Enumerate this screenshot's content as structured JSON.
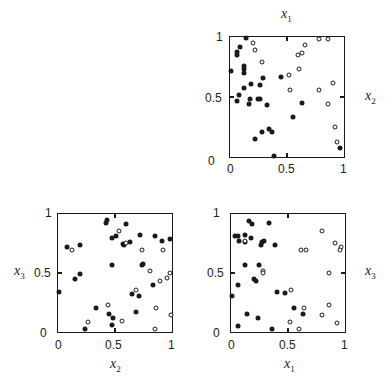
{
  "chart_data": [
    {
      "type": "scatter",
      "id": "x1_vs_x2",
      "title": "",
      "xlabel": "x1",
      "ylabel": "x2",
      "xlabel_position": "top",
      "ylabel_position": "right",
      "xlim": [
        0,
        1
      ],
      "ylim": [
        0,
        1
      ],
      "xticks": [
        "0",
        "0.5",
        "1"
      ],
      "yticks": [
        "0",
        "0.5",
        "1"
      ],
      "grid": false,
      "series": [
        {
          "name": "filled",
          "marker": "filled-circle",
          "points": [
            [
              0.13,
              1.0
            ],
            [
              0.08,
              0.92
            ],
            [
              0.05,
              0.88
            ],
            [
              0.05,
              0.86
            ],
            [
              0.0,
              0.72
            ],
            [
              0.12,
              0.76
            ],
            [
              0.12,
              0.74
            ],
            [
              0.12,
              0.7
            ],
            [
              0.12,
              0.58
            ],
            [
              0.18,
              0.61
            ],
            [
              0.29,
              0.66
            ],
            [
              0.26,
              0.6
            ],
            [
              0.07,
              0.52
            ],
            [
              0.05,
              0.47
            ],
            [
              0.17,
              0.48
            ],
            [
              0.16,
              0.44
            ],
            [
              0.24,
              0.48
            ],
            [
              0.26,
              0.48
            ],
            [
              0.32,
              0.43
            ],
            [
              0.45,
              0.67
            ],
            [
              0.63,
              0.45
            ],
            [
              0.55,
              0.33
            ],
            [
              0.34,
              0.23
            ],
            [
              0.37,
              0.2
            ],
            [
              0.28,
              0.2
            ],
            [
              0.21,
              0.14
            ],
            [
              0.38,
              0.0
            ],
            [
              0.97,
              0.07
            ]
          ]
        },
        {
          "name": "open",
          "marker": "open-circle",
          "points": [
            [
              0.2,
              0.96
            ],
            [
              0.21,
              0.9
            ],
            [
              0.28,
              0.8
            ],
            [
              0.52,
              0.69
            ],
            [
              0.53,
              0.56
            ],
            [
              0.6,
              0.86
            ],
            [
              0.63,
              0.87
            ],
            [
              0.66,
              0.94
            ],
            [
              0.61,
              0.74
            ],
            [
              0.79,
              0.99
            ],
            [
              0.87,
              0.99
            ],
            [
              0.79,
              0.56
            ],
            [
              0.91,
              0.62
            ],
            [
              0.87,
              0.44
            ],
            [
              0.93,
              0.25
            ],
            [
              0.95,
              0.12
            ]
          ]
        }
      ]
    },
    {
      "type": "scatter",
      "id": "x2_vs_x3",
      "title": "",
      "xlabel": "x2",
      "ylabel": "x3",
      "xlabel_position": "bottom",
      "ylabel_position": "left",
      "xlim": [
        0,
        1
      ],
      "ylim": [
        0,
        1
      ],
      "xticks": [
        "0",
        "0.5",
        "1"
      ],
      "yticks": [
        "0",
        "0.5",
        "1"
      ],
      "grid": false,
      "series": [
        {
          "name": "filled",
          "marker": "filled-circle",
          "points": [
            [
              0.43,
              0.96
            ],
            [
              0.42,
              0.93
            ],
            [
              0.6,
              0.92
            ],
            [
              0.47,
              0.8
            ],
            [
              0.51,
              0.82
            ],
            [
              0.57,
              0.75
            ],
            [
              0.58,
              0.74
            ],
            [
              0.63,
              0.77
            ],
            [
              0.72,
              0.83
            ],
            [
              0.86,
              0.82
            ],
            [
              0.92,
              0.78
            ],
            [
              0.99,
              0.79
            ],
            [
              0.07,
              0.72
            ],
            [
              0.19,
              0.74
            ],
            [
              0.47,
              0.57
            ],
            [
              0.74,
              0.57
            ],
            [
              0.75,
              0.58
            ],
            [
              0.19,
              0.49
            ],
            [
              0.14,
              0.45
            ],
            [
              0.84,
              0.4
            ],
            [
              0.0,
              0.34
            ],
            [
              0.65,
              0.32
            ],
            [
              0.71,
              0.3
            ],
            [
              0.33,
              0.2
            ],
            [
              0.45,
              0.15
            ],
            [
              0.48,
              0.11
            ],
            [
              0.69,
              0.16
            ],
            [
              0.47,
              0.05
            ],
            [
              0.23,
              0.02
            ]
          ]
        },
        {
          "name": "open",
          "marker": "open-circle",
          "points": [
            [
              0.54,
              0.86
            ],
            [
              0.6,
              0.76
            ],
            [
              0.12,
              0.7
            ],
            [
              0.74,
              0.7
            ],
            [
              0.93,
              0.7
            ],
            [
              0.81,
              0.52
            ],
            [
              0.96,
              0.46
            ],
            [
              0.9,
              0.43
            ],
            [
              0.69,
              0.35
            ],
            [
              0.44,
              0.22
            ],
            [
              0.87,
              0.2
            ],
            [
              1.0,
              0.14
            ],
            [
              0.56,
              0.09
            ],
            [
              0.26,
              0.08
            ],
            [
              0.86,
              0.02
            ],
            [
              0.99,
              0.5
            ]
          ]
        }
      ]
    },
    {
      "type": "scatter",
      "id": "x1_vs_x3",
      "title": "",
      "xlabel": "x1",
      "ylabel": "x3",
      "xlabel_position": "bottom",
      "ylabel_position": "right",
      "xlim": [
        0,
        1
      ],
      "ylim": [
        0,
        1
      ],
      "xticks": [
        "0",
        "0.5",
        "1"
      ],
      "yticks": [
        "0",
        "0.5",
        "1"
      ],
      "grid": false,
      "series": [
        {
          "name": "filled",
          "marker": "filled-circle",
          "points": [
            [
              0.15,
              0.95
            ],
            [
              0.18,
              0.92
            ],
            [
              0.33,
              0.93
            ],
            [
              0.03,
              0.82
            ],
            [
              0.05,
              0.82
            ],
            [
              0.06,
              0.78
            ],
            [
              0.12,
              0.83
            ],
            [
              0.12,
              0.77
            ],
            [
              0.17,
              0.8
            ],
            [
              0.27,
              0.77
            ],
            [
              0.29,
              0.78
            ],
            [
              0.26,
              0.74
            ],
            [
              0.38,
              0.74
            ],
            [
              0.12,
              0.57
            ],
            [
              0.24,
              0.57
            ],
            [
              0.2,
              0.45
            ],
            [
              0.21,
              0.43
            ],
            [
              0.05,
              0.4
            ],
            [
              0.4,
              0.34
            ],
            [
              0.47,
              0.33
            ],
            [
              0.0,
              0.3
            ],
            [
              0.55,
              0.2
            ],
            [
              0.63,
              0.15
            ],
            [
              0.13,
              0.15
            ],
            [
              0.23,
              0.11
            ],
            [
              0.05,
              0.04
            ],
            [
              0.36,
              0.02
            ]
          ]
        },
        {
          "name": "open",
          "marker": "open-circle",
          "points": [
            [
              0.12,
              0.78
            ],
            [
              0.28,
              0.52
            ],
            [
              0.28,
              0.5
            ],
            [
              0.62,
              0.7
            ],
            [
              0.66,
              0.7
            ],
            [
              0.8,
              0.86
            ],
            [
              0.92,
              0.76
            ],
            [
              0.97,
              0.72
            ],
            [
              0.96,
              0.7
            ],
            [
              0.87,
              0.5
            ],
            [
              0.53,
              0.35
            ],
            [
              0.64,
              0.2
            ],
            [
              0.87,
              0.22
            ],
            [
              0.8,
              0.14
            ],
            [
              0.52,
              0.08
            ],
            [
              0.6,
              0.02
            ],
            [
              0.94,
              0.07
            ]
          ]
        }
      ]
    }
  ],
  "panels": {
    "top_right": {
      "xlabel": "x",
      "xlabel_sub": "1",
      "ylabel": "x",
      "ylabel_sub": "2",
      "tick_x": [
        "0",
        "0.5",
        "1"
      ],
      "tick_y": [
        "0",
        "0.5",
        "1"
      ]
    },
    "bottom_left": {
      "xlabel": "x",
      "xlabel_sub": "2",
      "ylabel": "x",
      "ylabel_sub": "3",
      "tick_x": [
        "0",
        "0.5",
        "1"
      ],
      "tick_y": [
        "0",
        "0.5",
        "1"
      ]
    },
    "bottom_right": {
      "xlabel": "x",
      "xlabel_sub": "1",
      "ylabel": "x",
      "ylabel_sub": "3",
      "tick_x": [
        "0",
        "0.5",
        "1"
      ],
      "tick_y": [
        "0",
        "0.5",
        "1"
      ]
    }
  },
  "colors": {
    "ink": "#1a1a1a",
    "background": "#ffffff"
  }
}
